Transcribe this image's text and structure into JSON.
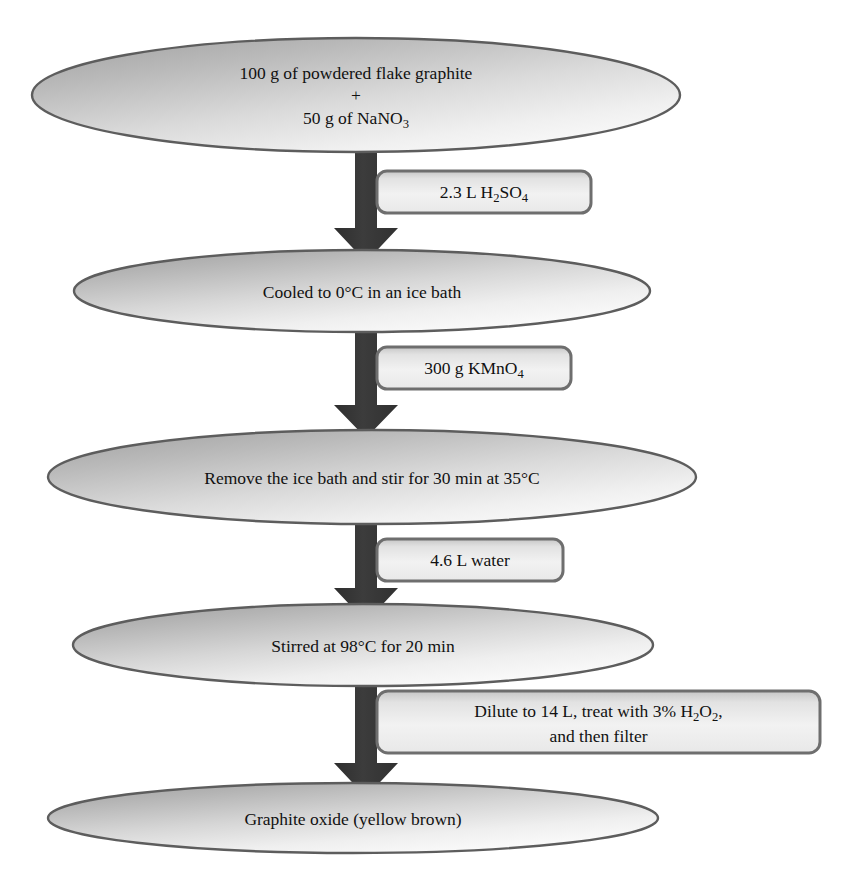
{
  "diagram": {
    "colors": {
      "ellipse_fill_dark": "#a9a9a9",
      "ellipse_fill_light": "#f6f6f6",
      "ellipse_stroke": "#5a5a5a",
      "rect_fill_dark": "#bdbdbd",
      "rect_fill_light": "#f2f2f2",
      "rect_stroke": "#6b6b6b",
      "arrow_fill": "#3a3a3a",
      "text": "#111111",
      "background": "#ffffff"
    },
    "nodes": [
      {
        "id": "node-reagents",
        "shape": "ellipse",
        "name": "starting-materials-node",
        "lines": [
          {
            "text": "100 g of powdered flake graphite"
          },
          {
            "text": "+"
          },
          {
            "text": "50 g of NaNO",
            "sub": "3"
          }
        ]
      },
      {
        "id": "node-cooled",
        "shape": "ellipse",
        "name": "cooling-step-node",
        "lines": [
          {
            "text": "Cooled to 0°C in an ice bath"
          }
        ]
      },
      {
        "id": "node-stir35",
        "shape": "ellipse",
        "name": "stir-35c-step-node",
        "lines": [
          {
            "text": "Remove the ice bath and stir for 30 min at 35°C"
          }
        ]
      },
      {
        "id": "node-stir98",
        "shape": "ellipse",
        "name": "stir-98c-step-node",
        "lines": [
          {
            "text": "Stirred at 98°C for 20 min"
          }
        ]
      },
      {
        "id": "node-product",
        "shape": "ellipse",
        "name": "product-node",
        "lines": [
          {
            "text": "Graphite oxide (yellow brown)"
          }
        ]
      }
    ],
    "reagent_labels": [
      {
        "id": "label-h2so4",
        "shape": "rounded-rect",
        "name": "reagent-label-sulfuric-acid",
        "lines": [
          {
            "text": "2.3 L H",
            "sub": "2",
            "text2": "SO",
            "sub2": "4"
          }
        ],
        "plain": "2.3 L H2SO4"
      },
      {
        "id": "label-kmno4",
        "shape": "rounded-rect",
        "name": "reagent-label-potassium-permanganate",
        "lines": [
          {
            "text": "300 g KMnO",
            "sub": "4"
          }
        ],
        "plain": "300 g KMnO4"
      },
      {
        "id": "label-water",
        "shape": "rounded-rect",
        "name": "reagent-label-water",
        "lines": [
          {
            "text": "4.6 L water"
          }
        ],
        "plain": "4.6 L water"
      },
      {
        "id": "label-dilute",
        "shape": "rounded-rect",
        "name": "reagent-label-dilute-and-filter",
        "lines": [
          {
            "text": "Dilute to 14 L, treat with 3% H",
            "sub": "2",
            "text2": "O",
            "sub2": "2",
            "text3": ","
          },
          {
            "text": "and then filter"
          }
        ],
        "plain": "Dilute to 14 L, treat with 3% H2O2, and then filter"
      }
    ],
    "arrows": [
      {
        "id": "arrow-1",
        "name": "flow-arrow-down-1",
        "from": "node-reagents",
        "to": "node-cooled"
      },
      {
        "id": "arrow-2",
        "name": "flow-arrow-down-2",
        "from": "node-cooled",
        "to": "node-stir35"
      },
      {
        "id": "arrow-3",
        "name": "flow-arrow-down-3",
        "from": "node-stir35",
        "to": "node-stir98"
      },
      {
        "id": "arrow-4",
        "name": "flow-arrow-down-4",
        "from": "node-stir98",
        "to": "node-product"
      }
    ],
    "text_values": {
      "node_0_line_0": "100 g of powdered flake graphite",
      "node_0_line_1": "+",
      "node_0_line_2_main": "50 g of NaNO",
      "node_0_line_2_sub": "3",
      "node_1_line_0": "Cooled to 0°C in an ice bath",
      "node_2_line_0": "Remove the ice bath and stir for 30 min at 35°C",
      "node_3_line_0": "Stirred at 98°C for 20 min",
      "node_4_line_0": "Graphite oxide (yellow brown)",
      "rect_0_a": "2.3 L H",
      "rect_0_sub1": "2",
      "rect_0_b": "SO",
      "rect_0_sub2": "4",
      "rect_1_a": "300 g KMnO",
      "rect_1_sub1": "4",
      "rect_2_a": "4.6 L water",
      "rect_3_a": "Dilute to 14 L, treat with 3% H",
      "rect_3_sub1": "2",
      "rect_3_b": "O",
      "rect_3_sub2": "2",
      "rect_3_c": ",",
      "rect_3_line2": "and then filter"
    }
  }
}
